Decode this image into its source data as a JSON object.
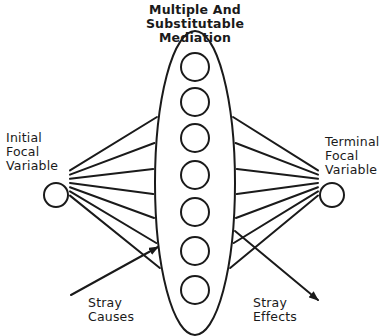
{
  "title": {
    "line1": "Multiple And",
    "line2": "Substitutable",
    "line3": "Mediation"
  },
  "left_node": {
    "line1": "Initial",
    "line2": "Focal",
    "line3": "Variable"
  },
  "right_node": {
    "line1": "Terminal",
    "line2": "Focal",
    "line3": "Variable"
  },
  "stray_causes": {
    "line1": "Stray",
    "line2": "Causes"
  },
  "stray_effects": {
    "line1": "Stray",
    "line2": "Effects"
  },
  "colors": {
    "stroke": "#1a1a1a",
    "background": "#ffffff"
  },
  "mediators": {
    "count": 7,
    "y_positions": [
      67,
      102,
      138,
      175,
      212,
      251,
      290
    ]
  },
  "connections": {
    "left_edge_y": [
      117,
      143,
      169,
      194,
      218,
      243,
      268
    ],
    "right_edge_y": [
      117,
      143,
      169,
      194,
      218,
      243,
      268
    ]
  }
}
